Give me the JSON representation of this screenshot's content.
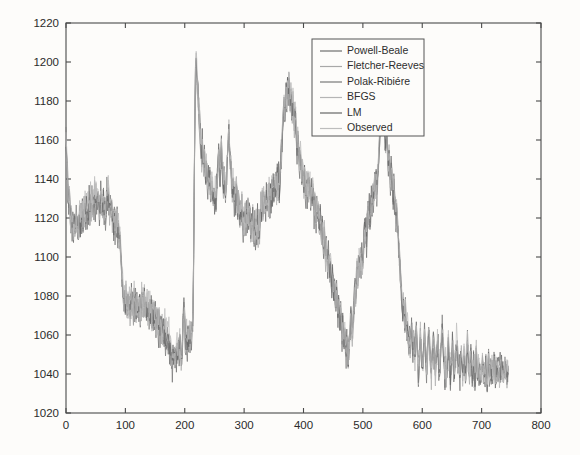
{
  "chart_data": {
    "type": "line",
    "title": "",
    "xlabel": "",
    "ylabel": "",
    "xlim": [
      0,
      800
    ],
    "ylim": [
      1020,
      1220
    ],
    "xticks": [
      0,
      100,
      200,
      300,
      400,
      500,
      600,
      700,
      800
    ],
    "yticks": [
      1020,
      1040,
      1060,
      1080,
      1100,
      1120,
      1140,
      1160,
      1180,
      1200,
      1220
    ],
    "grid": false,
    "legend_position": "top-right",
    "legend_entries": [
      {
        "label": "Powell-Beale",
        "color": "#6e6e6e"
      },
      {
        "label": "Fletcher-Reeves",
        "color": "#a8a8a8"
      },
      {
        "label": "Polak-Ribiére",
        "color": "#787878"
      },
      {
        "label": "BFGS",
        "color": "#b5b5b5"
      },
      {
        "label": "LM",
        "color": "#666666"
      },
      {
        "label": "Observed",
        "color": "#bdbdbd"
      }
    ],
    "series": [
      {
        "name": "Observed",
        "color": "#9a9a9a",
        "x_start": 0,
        "x_end": 745,
        "values": [
          1160,
          1150,
          1142,
          1133,
          1127,
          1130,
          1124,
          1118,
          1121,
          1115,
          1119,
          1113,
          1117,
          1110,
          1116,
          1121,
          1114,
          1119,
          1112,
          1118,
          1123,
          1116,
          1122,
          1117,
          1124,
          1118,
          1125,
          1119,
          1126,
          1120,
          1127,
          1121,
          1128,
          1122,
          1129,
          1123,
          1130,
          1124,
          1131,
          1125,
          1132,
          1126,
          1133,
          1127,
          1134,
          1128,
          1131,
          1125,
          1129,
          1123,
          1127,
          1133,
          1126,
          1131,
          1124,
          1129,
          1122,
          1127,
          1121,
          1126,
          1134,
          1128,
          1135,
          1129,
          1123,
          1128,
          1121,
          1126,
          1119,
          1124,
          1117,
          1122,
          1115,
          1120,
          1113,
          1118,
          1110,
          1115,
          1108,
          1112,
          1105,
          1098,
          1092,
          1086,
          1080,
          1075,
          1083,
          1077,
          1084,
          1078,
          1072,
          1078,
          1071,
          1077,
          1070,
          1076,
          1082,
          1075,
          1081,
          1074,
          1080,
          1073,
          1079,
          1072,
          1078,
          1071,
          1077,
          1070,
          1076,
          1069,
          1075,
          1081,
          1074,
          1080,
          1073,
          1079,
          1072,
          1078,
          1071,
          1077,
          1070,
          1076,
          1069,
          1075,
          1068,
          1074,
          1067,
          1073,
          1066,
          1072,
          1065,
          1071,
          1064,
          1070,
          1063,
          1069,
          1062,
          1068,
          1061,
          1067,
          1060,
          1066,
          1059,
          1065,
          1058,
          1064,
          1057,
          1063,
          1056,
          1062,
          1055,
          1061,
          1054,
          1060,
          1053,
          1049,
          1045,
          1051,
          1046,
          1052,
          1047,
          1053,
          1048,
          1054,
          1049,
          1055,
          1050,
          1056,
          1051,
          1047,
          1053,
          1059,
          1066,
          1072,
          1066,
          1060,
          1054,
          1060,
          1054,
          1061,
          1055,
          1062,
          1056,
          1063,
          1057,
          1064,
          1070,
          1090,
          1130,
          1170,
          1195,
          1200,
          1192,
          1186,
          1180,
          1174,
          1168,
          1162,
          1156,
          1150,
          1158,
          1151,
          1145,
          1152,
          1146,
          1140,
          1147,
          1141,
          1135,
          1142,
          1136,
          1143,
          1137,
          1131,
          1138,
          1132,
          1126,
          1133,
          1127,
          1134,
          1128,
          1135,
          1142,
          1148,
          1155,
          1148,
          1142,
          1149,
          1155,
          1148,
          1142,
          1136,
          1143,
          1137,
          1131,
          1138,
          1144,
          1151,
          1158,
          1164,
          1157,
          1151,
          1145,
          1139,
          1133,
          1140,
          1134,
          1128,
          1135,
          1129,
          1136,
          1130,
          1124,
          1131,
          1125,
          1119,
          1126,
          1120,
          1127,
          1121,
          1115,
          1122,
          1116,
          1123,
          1117,
          1124,
          1118,
          1125,
          1119,
          1126,
          1120,
          1114,
          1121,
          1115,
          1122,
          1116,
          1110,
          1117,
          1111,
          1118,
          1112,
          1119,
          1113,
          1120,
          1114,
          1121,
          1127,
          1121,
          1128,
          1122,
          1129,
          1123,
          1130,
          1124,
          1131,
          1125,
          1132,
          1126,
          1133,
          1127,
          1134,
          1128,
          1135,
          1129,
          1136,
          1130,
          1137,
          1131,
          1138,
          1132,
          1139,
          1133,
          1140,
          1134,
          1141,
          1147,
          1154,
          1160,
          1167,
          1173,
          1180,
          1174,
          1181,
          1187,
          1181,
          1188,
          1182,
          1190,
          1184,
          1178,
          1185,
          1179,
          1173,
          1180,
          1174,
          1168,
          1175,
          1169,
          1163,
          1157,
          1164,
          1158,
          1152,
          1146,
          1153,
          1147,
          1141,
          1148,
          1142,
          1136,
          1143,
          1137,
          1131,
          1138,
          1132,
          1139,
          1133,
          1140,
          1134,
          1128,
          1135,
          1129,
          1136,
          1130,
          1124,
          1131,
          1125,
          1119,
          1126,
          1120,
          1127,
          1121,
          1115,
          1122,
          1116,
          1110,
          1117,
          1111,
          1105,
          1112,
          1106,
          1100,
          1107,
          1101,
          1095,
          1102,
          1096,
          1090,
          1097,
          1091,
          1085,
          1092,
          1086,
          1080,
          1087,
          1081,
          1075,
          1082,
          1076,
          1070,
          1077,
          1071,
          1065,
          1072,
          1066,
          1060,
          1067,
          1061,
          1055,
          1062,
          1056,
          1050,
          1057,
          1051,
          1046,
          1052,
          1058,
          1064,
          1071,
          1065,
          1059,
          1066,
          1072,
          1079,
          1085,
          1079,
          1086,
          1092,
          1086,
          1093,
          1099,
          1093,
          1100,
          1094,
          1101,
          1095,
          1102,
          1108,
          1115,
          1109,
          1116,
          1110,
          1117,
          1123,
          1117,
          1124,
          1118,
          1125,
          1131,
          1125,
          1132,
          1126,
          1133,
          1139,
          1133,
          1140,
          1134,
          1141,
          1147,
          1154,
          1160,
          1167,
          1173,
          1167,
          1174,
          1168,
          1175,
          1169,
          1163,
          1157,
          1164,
          1158,
          1152,
          1146,
          1153,
          1147,
          1141,
          1148,
          1142,
          1136,
          1130,
          1137,
          1131,
          1125,
          1119,
          1126,
          1120,
          1114,
          1108,
          1102,
          1096,
          1090,
          1084,
          1078,
          1072,
          1078,
          1072,
          1066,
          1072,
          1066,
          1060,
          1066,
          1060,
          1054,
          1060,
          1054,
          1060,
          1066,
          1060,
          1054,
          1060,
          1054,
          1048,
          1054,
          1060,
          1054,
          1048,
          1042,
          1048,
          1054,
          1060,
          1054,
          1048,
          1042,
          1048,
          1054,
          1060,
          1054,
          1048,
          1042,
          1048,
          1054,
          1060,
          1056,
          1050,
          1044,
          1040,
          1046,
          1052,
          1058,
          1052,
          1046,
          1040,
          1046,
          1052,
          1058,
          1052,
          1046,
          1040,
          1046,
          1052,
          1058,
          1064,
          1058,
          1052,
          1046,
          1040,
          1046,
          1040,
          1044,
          1050,
          1056,
          1050,
          1044,
          1038,
          1044,
          1050,
          1056,
          1050,
          1044,
          1040,
          1046,
          1052,
          1058,
          1052,
          1046,
          1040,
          1044,
          1040,
          1046,
          1052,
          1046,
          1040,
          1046,
          1052,
          1046,
          1040,
          1044,
          1050,
          1056,
          1050,
          1044,
          1038,
          1044,
          1050,
          1044,
          1038,
          1042,
          1048,
          1042,
          1038,
          1044,
          1050,
          1044,
          1040,
          1046,
          1040,
          1044,
          1040,
          1038,
          1042,
          1046,
          1042,
          1038,
          1044,
          1040,
          1046,
          1042,
          1038,
          1042,
          1046,
          1042,
          1040,
          1044,
          1040,
          1044,
          1040,
          1042,
          1046,
          1042,
          1038,
          1042,
          1040,
          1044,
          1040,
          1042,
          1038,
          1042,
          1040,
          1044,
          1040,
          1042,
          1040,
          1038,
          1042,
          1040,
          1044,
          1040,
          1042,
          1040
        ]
      }
    ]
  },
  "axes": {
    "y_tick_labels": [
      "1220",
      "1200",
      "1180",
      "1160",
      "1140",
      "1120",
      "1100",
      "1080",
      "1060",
      "1040",
      "1020"
    ],
    "x_tick_labels": [
      "0",
      "100",
      "200",
      "300",
      "400",
      "500",
      "600",
      "700",
      "800"
    ]
  }
}
